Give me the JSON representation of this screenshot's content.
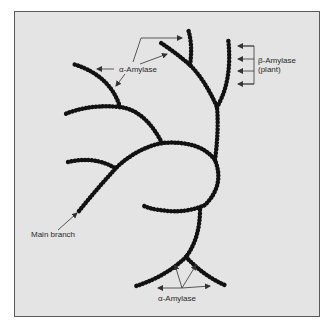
{
  "figure": {
    "labels": {
      "alpha_amylase_top": "α-Amylase",
      "beta_amylase_line1": "β-Amylase",
      "beta_amylase_line2": "(plant)",
      "main_branch": "Main branch",
      "alpha_amylase_bottom": "α-Amylase"
    },
    "colors": {
      "panel_background": "#e4e4e4",
      "panel_border": "#5a5a5a",
      "chain_beads": "#111111",
      "arrows": "#333333",
      "text": "#2a2a2a"
    }
  }
}
